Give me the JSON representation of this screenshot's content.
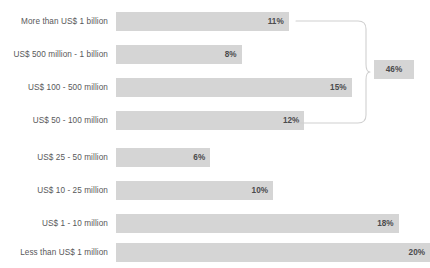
{
  "chart_data": {
    "type": "bar",
    "orientation": "horizontal",
    "title": "",
    "subtitle": "",
    "xlabel": "",
    "ylabel": "",
    "grid": false,
    "legend": null,
    "xlim": [
      0,
      20
    ],
    "value_suffix": "%",
    "categories": [
      "More than US$ 1 billion",
      "US$ 500 million - 1 billion",
      "US$ 100 - 500 million",
      "US$ 50 - 100 million",
      "US$ 25 - 50 million",
      "US$ 10 - 25 million",
      "US$ 1 - 10 million",
      "Less than US$ 1 million"
    ],
    "values": [
      11,
      8,
      15,
      12,
      6,
      10,
      18,
      20
    ],
    "value_labels": [
      "11%",
      "8%",
      "15%",
      "12%",
      "6%",
      "10%",
      "18%",
      "20%"
    ],
    "annotations": [
      {
        "type": "bracket",
        "label": "46%",
        "spans_categories": [
          "More than US$ 1 billion",
          "US$ 500 million - 1 billion",
          "US$ 100 - 500 million",
          "US$ 50 - 100 million"
        ],
        "value": 46
      }
    ],
    "colors": {
      "bar_fill": "#d5d5d5",
      "badge_fill": "#d5d5d5",
      "label_text": "#58585a",
      "value_text": "#4b4b4d",
      "bracket_line": "#d0d0d0",
      "background": "#ffffff"
    }
  }
}
